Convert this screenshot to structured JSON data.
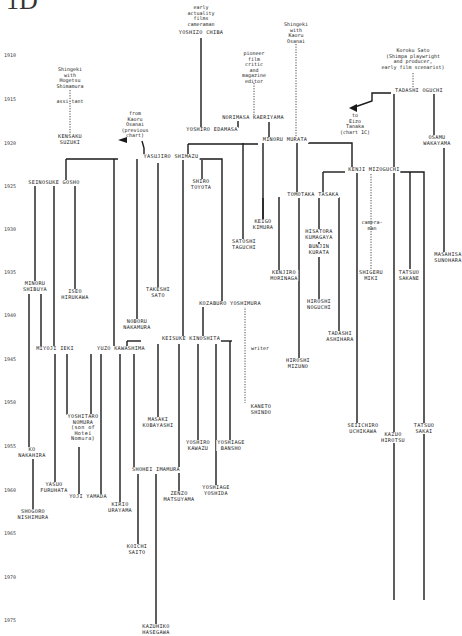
{
  "header": {
    "label": "1D"
  },
  "years": [
    {
      "label": "1910",
      "y": 55
    },
    {
      "label": "1915",
      "y": 99
    },
    {
      "label": "1920",
      "y": 143
    },
    {
      "label": "1925",
      "y": 186
    },
    {
      "label": "1930",
      "y": 229
    },
    {
      "label": "1935",
      "y": 272
    },
    {
      "label": "1940",
      "y": 315
    },
    {
      "label": "1945",
      "y": 359
    },
    {
      "label": "1950",
      "y": 402
    },
    {
      "label": "1955",
      "y": 446
    },
    {
      "label": "1960",
      "y": 490
    },
    {
      "label": "1965",
      "y": 533
    },
    {
      "label": "1970",
      "y": 577
    },
    {
      "label": "1975",
      "y": 620
    }
  ],
  "notes": [
    {
      "id": "early-actuality",
      "text": "early\nactuality\nfilms\ncameraman",
      "x": 201,
      "y": 5
    },
    {
      "id": "shingeki-shimamura",
      "text": "Shingeki\nwith\nHogetsu\nShimamura",
      "x": 70,
      "y": 67
    },
    {
      "id": "assistant",
      "text": "assi-tant",
      "x": 70,
      "y": 99
    },
    {
      "id": "from-osanai",
      "text": "from\nKaoru\nOsanai\n(previous\nchart)",
      "x": 135,
      "y": 111
    },
    {
      "id": "pioneer-critic",
      "text": "pioneer\nfilm\ncritic\nand\nmagazine\neditor",
      "x": 254,
      "y": 51
    },
    {
      "id": "shingeki-osanai",
      "text": "Shingeki\nwith\nKaoru\nOsanai",
      "x": 296,
      "y": 22
    },
    {
      "id": "koroku-sato",
      "text": "Koroku Sato\n(Shimpa playwright\nand producer,\nearly film scenarist)",
      "x": 413,
      "y": 48
    },
    {
      "id": "to-tanaka",
      "text": "to\nEizo\nTanaka\n(chart 1C)",
      "x": 355,
      "y": 113
    },
    {
      "id": "cameraman",
      "text": "camera-\nman",
      "x": 372,
      "y": 220
    },
    {
      "id": "writer",
      "text": "writer",
      "x": 260,
      "y": 346
    }
  ],
  "people": [
    {
      "id": "yoshizo-chiba",
      "text": "YOSHIZO CHIBA",
      "x": 201,
      "y": 33
    },
    {
      "id": "kensaku-suzuki",
      "text": "KENSAKU\nSUZUKI",
      "x": 70,
      "y": 137
    },
    {
      "id": "yoshiro-edamasa",
      "text": "YOSHIRO EDAMASA",
      "x": 212,
      "y": 130
    },
    {
      "id": "norimasa-kaeriyama",
      "text": "NORIMASA KAERIYAMA",
      "x": 253,
      "y": 118
    },
    {
      "id": "minoru-murata",
      "text": "MINORU MURATA",
      "x": 285,
      "y": 140
    },
    {
      "id": "tadashi-oguchi",
      "text": "TADASHI OGUCHI",
      "x": 419,
      "y": 91
    },
    {
      "id": "osamu-wakayama",
      "text": "OSAMU\nWAKAYAMA",
      "x": 437,
      "y": 138
    },
    {
      "id": "yasujiro-shimazu",
      "text": "YASUJIRO SHIMAZU",
      "x": 171,
      "y": 157
    },
    {
      "id": "kenji-mizoguchi",
      "text": "KENJI MIZOGUCHI",
      "x": 374,
      "y": 170
    },
    {
      "id": "seinosuke-gosho",
      "text": "SEINOSUKE GOSHO",
      "x": 54,
      "y": 183
    },
    {
      "id": "shiro-toyota",
      "text": "SHIRO\nTOYOTA",
      "x": 201,
      "y": 182
    },
    {
      "id": "tomotaka-tasaka",
      "text": "TOMOTAKA TASAKA",
      "x": 313,
      "y": 195
    },
    {
      "id": "keigo-kimura",
      "text": "KEIGO\nKIMURA",
      "x": 263,
      "y": 222
    },
    {
      "id": "satoshi-taguchi",
      "text": "SATOSHI\nTAGUCHI",
      "x": 244,
      "y": 242
    },
    {
      "id": "hisatora-kumagaya",
      "text": "HISATORA\nKUMAGAYA",
      "x": 319,
      "y": 232
    },
    {
      "id": "bunjin-kurata",
      "text": "BUNJIN\nKURATA",
      "x": 319,
      "y": 247
    },
    {
      "id": "kenjiro-morinaga",
      "text": "KENJIRO\nMORINAGA",
      "x": 284,
      "y": 273
    },
    {
      "id": "shigeru-miki",
      "text": "SHIGERU\nMIKI",
      "x": 371,
      "y": 273
    },
    {
      "id": "tatsuo-sakane",
      "text": "TATSUO\nSAKANE",
      "x": 409,
      "y": 273
    },
    {
      "id": "masahisa-sunohara",
      "text": "MASAHISA\nSUNOHARA",
      "x": 448,
      "y": 255
    },
    {
      "id": "minoru-shibuya",
      "text": "MINORU\nSHIBUYA",
      "x": 35,
      "y": 284
    },
    {
      "id": "iseo-hirukawa",
      "text": "ISEO\nHIRUKAWA",
      "x": 75,
      "y": 292
    },
    {
      "id": "takeshi-sato",
      "text": "TAKESHI\nSATO",
      "x": 158,
      "y": 290
    },
    {
      "id": "hiroshi-noguchi",
      "text": "HIROSHI\nNOGUCHI",
      "x": 319,
      "y": 302
    },
    {
      "id": "kozaburo-yoshimura",
      "text": "KOZABURO YOSHIMURA",
      "x": 230,
      "y": 304
    },
    {
      "id": "noboru-nakamura",
      "text": "NOBORU\nNAKAMURA",
      "x": 137,
      "y": 322
    },
    {
      "id": "tadashi-ashihara",
      "text": "TADASHI\nASHIHARA",
      "x": 340,
      "y": 334
    },
    {
      "id": "keisuke-kinoshita",
      "text": "KEISUKE KINOSHITA",
      "x": 191,
      "y": 339
    },
    {
      "id": "miyoji-ieki",
      "text": "MIYOJI IEKI",
      "x": 55,
      "y": 349
    },
    {
      "id": "yuzo-kawashima",
      "text": "YUZO KAWASHIMA",
      "x": 121,
      "y": 349
    },
    {
      "id": "hiroshi-mizuno",
      "text": "HIROSHI\nMIZUNO",
      "x": 298,
      "y": 361
    },
    {
      "id": "yoshitaro-nomura",
      "text": "YOSHITARO\nNOMURA\n(son of\nHotei\nNomura)",
      "x": 83,
      "y": 417
    },
    {
      "id": "masaki-kobayashi",
      "text": "MASAKI\nKOBAYASHI",
      "x": 158,
      "y": 420
    },
    {
      "id": "kaneto-shindo",
      "text": "KANETO\nSHINDO",
      "x": 261,
      "y": 407
    },
    {
      "id": "seiichiro-uchikawa",
      "text": "SEIICHIRO\nUCHIKAWA",
      "x": 363,
      "y": 426
    },
    {
      "id": "tatsuo-sakai",
      "text": "TATSUO\nSAKAI",
      "x": 424,
      "y": 426
    },
    {
      "id": "kazuo-hirotsu",
      "text": "KAZUO\nHIROTSU",
      "x": 393,
      "y": 435
    },
    {
      "id": "yoshiro-kawazu",
      "text": "YOSHIRO\nKAWAZU",
      "x": 198,
      "y": 443
    },
    {
      "id": "yoshiage-bansho",
      "text": "YOSHIAGE\nBANSHO",
      "x": 231,
      "y": 443
    },
    {
      "id": "ko-nakahira",
      "text": "KO\nNAKAHIRA",
      "x": 32,
      "y": 450
    },
    {
      "id": "shohei-imamura",
      "text": "SHOHEI IMAMURA",
      "x": 156,
      "y": 470
    },
    {
      "id": "yasuo-furuhata",
      "text": "YASUO\nFURUHATA",
      "x": 54,
      "y": 485
    },
    {
      "id": "yoshiage-yoshida",
      "text": "YOSHIAGE\nYOSHIDA",
      "x": 216,
      "y": 488
    },
    {
      "id": "yoji-yamada",
      "text": "YOJI YAMADA",
      "x": 88,
      "y": 497
    },
    {
      "id": "zenzo-matsuyama",
      "text": "ZENZO\nMATSUYAMA",
      "x": 179,
      "y": 494
    },
    {
      "id": "kirio-urayama",
      "text": "KIRIO\nURAYAMA",
      "x": 120,
      "y": 505
    },
    {
      "id": "shogoro-nishimura",
      "text": "SHOGORO\nNISHIMURA",
      "x": 33,
      "y": 512
    },
    {
      "id": "koichi-saito",
      "text": "KOICHI\nSAITO",
      "x": 137,
      "y": 547
    },
    {
      "id": "kazuhiko-hasegawa",
      "text": "KAZUHIKO\nHASEGAWA",
      "x": 156,
      "y": 627
    }
  ],
  "lines": [
    {
      "d": "M201 38 V129",
      "dash": false
    },
    {
      "d": "M70 90 V135",
      "dash": true
    },
    {
      "d": "M296 44 V138",
      "dash": true
    },
    {
      "d": "M254 83 V116",
      "dash": true
    },
    {
      "d": "M413 73 V89",
      "dash": true
    },
    {
      "d": "M238 120 V128",
      "dash": false
    },
    {
      "d": "M269 122 V139",
      "dash": false
    },
    {
      "d": "M188 144 H258",
      "dash": false
    },
    {
      "d": "M188 144 V155",
      "dash": false
    },
    {
      "d": "M308 143 H352 V167",
      "dash": false
    },
    {
      "d": "M243 143 V240",
      "dash": false
    },
    {
      "d": "M263 143 V220",
      "dash": false
    },
    {
      "d": "M297 143 V193",
      "dash": false
    },
    {
      "d": "M391 93 H372 V101 L352 108",
      "dash": false
    },
    {
      "d": "M394 94 V600",
      "dash": false
    },
    {
      "d": "M434 94 V136",
      "dash": false
    },
    {
      "d": "M444 148 V253",
      "dash": false
    },
    {
      "d": "M142 141 L144 148 V155",
      "dash": false
    },
    {
      "d": "M66 159 H118",
      "dash": false
    },
    {
      "d": "M66 159 V181",
      "dash": false
    },
    {
      "d": "M114 159 V348",
      "dash": false
    },
    {
      "d": "M137 159 V320",
      "dash": false
    },
    {
      "d": "M158 163 V288",
      "dash": false
    },
    {
      "d": "M195 159 H222 V302",
      "dash": false
    },
    {
      "d": "M202 160 V180",
      "dash": false
    },
    {
      "d": "M183 159 V338",
      "dash": false
    },
    {
      "d": "M323 172 H345",
      "dash": false
    },
    {
      "d": "M323 172 V193",
      "dash": false
    },
    {
      "d": "M357 172 V424",
      "dash": false
    },
    {
      "d": "M371 174 V271",
      "dash": true
    },
    {
      "d": "M396 172 H424 V600",
      "dash": false
    },
    {
      "d": "M410 172 V269",
      "dash": false
    },
    {
      "d": "M279 197 V271",
      "dash": false
    },
    {
      "d": "M299 197 V360",
      "dash": false
    },
    {
      "d": "M319 197 V230",
      "dash": false
    },
    {
      "d": "M339 197 V332",
      "dash": false
    },
    {
      "d": "M319 242 V245",
      "dash": false
    },
    {
      "d": "M319 257 V300",
      "dash": false
    },
    {
      "d": "M35 186 V282",
      "dash": false
    },
    {
      "d": "M54 186 V347",
      "dash": false
    },
    {
      "d": "M75 186 V290",
      "dash": false
    },
    {
      "d": "M29 294 V448",
      "dash": false
    },
    {
      "d": "M41 294 V347",
      "dash": false
    },
    {
      "d": "M203 306 V338",
      "dash": false
    },
    {
      "d": "M245 306 V403",
      "dash": true
    },
    {
      "d": "M242 306 H247",
      "dash": false
    },
    {
      "d": "M127 341 H141",
      "dash": false
    },
    {
      "d": "M127 341 V347",
      "dash": false
    },
    {
      "d": "M210 341 H232",
      "dash": false
    },
    {
      "d": "M158 344 V418",
      "dash": false
    },
    {
      "d": "M179 344 V492",
      "dash": false
    },
    {
      "d": "M198 344 V441",
      "dash": false
    },
    {
      "d": "M216 344 V486",
      "dash": false
    },
    {
      "d": "M230 341 V441",
      "dash": false
    },
    {
      "d": "M55 354 V483",
      "dash": false
    },
    {
      "d": "M67 354 V415",
      "dash": false
    },
    {
      "d": "M91 354 V415",
      "dash": false
    },
    {
      "d": "M101 354 V495",
      "dash": false
    },
    {
      "d": "M120 354 V503",
      "dash": false
    },
    {
      "d": "M134 354 V468",
      "dash": false
    },
    {
      "d": "M33 459 V510",
      "dash": false
    },
    {
      "d": "M79 447 V495",
      "dash": false
    },
    {
      "d": "M138 474 V545",
      "dash": false
    },
    {
      "d": "M156 474 V625",
      "dash": false
    },
    {
      "d": "M263 198 V220",
      "dash": false
    }
  ],
  "arrows": [
    {
      "id": "from-osanai-arrow",
      "points": "118,140 127,137 127,143"
    },
    {
      "id": "to-tanaka-arrow",
      "points": "349,108 357,104 357,112"
    }
  ]
}
